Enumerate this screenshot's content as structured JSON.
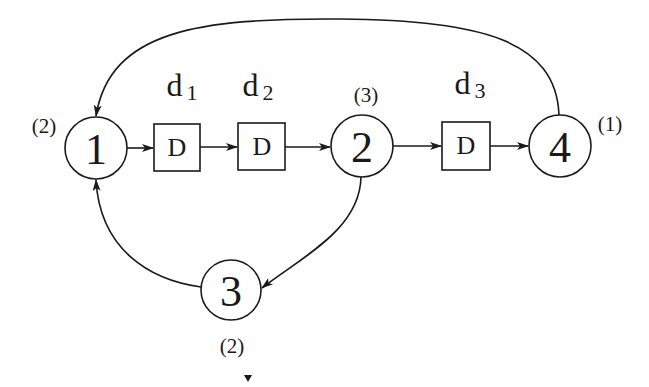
{
  "diagram": {
    "title": "",
    "nodes": [
      {
        "id": "1",
        "label": "1",
        "weight": "(2)"
      },
      {
        "id": "2",
        "label": "2",
        "weight": "(3)"
      },
      {
        "id": "3",
        "label": "3",
        "weight": "(2)"
      },
      {
        "id": "4",
        "label": "4",
        "weight": "(1)"
      }
    ],
    "delays": [
      {
        "id": "d1",
        "box_label": "D",
        "name": "d",
        "sub": "1"
      },
      {
        "id": "d2",
        "box_label": "D",
        "name": "d",
        "sub": "2"
      },
      {
        "id": "d3",
        "box_label": "D",
        "name": "d",
        "sub": "3"
      }
    ],
    "edges": [
      {
        "from": "1",
        "to": "d1"
      },
      {
        "from": "d1",
        "to": "d2"
      },
      {
        "from": "d2",
        "to": "2"
      },
      {
        "from": "2",
        "to": "d3"
      },
      {
        "from": "d3",
        "to": "4"
      },
      {
        "from": "4",
        "to": "1"
      },
      {
        "from": "2",
        "to": "3"
      },
      {
        "from": "3",
        "to": "1"
      }
    ],
    "colors": {
      "stroke": "#1a1a1a",
      "background": "#ffffff"
    }
  }
}
